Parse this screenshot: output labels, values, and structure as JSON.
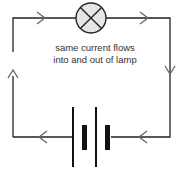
{
  "diagram": {
    "caption_line1": "same current flows",
    "caption_line2": "into and out of lamp",
    "components": [
      "lamp",
      "cell",
      "cell"
    ],
    "wire_color": "#222222",
    "arrow_color": "#666666",
    "lamp_fill": "#e6e6e6"
  }
}
